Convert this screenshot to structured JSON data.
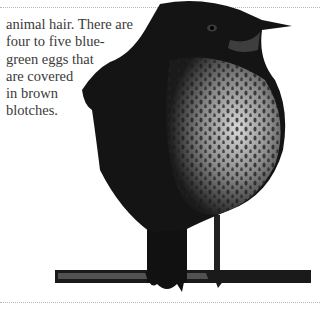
{
  "article": {
    "lines": [
      "animal hair. There are",
      "four to five blue-",
      "green eggs that",
      "are covered",
      "in brown",
      "blotches."
    ],
    "line_words": {
      "l0": [
        "animal",
        "hair.",
        "There",
        "are"
      ],
      "l1": [
        "four",
        "to",
        "five",
        "blue-"
      ],
      "l3": [
        "are",
        "covered"
      ],
      "l4": [
        "in",
        "brown"
      ]
    }
  },
  "image": {
    "subject": "bird-perched-on-branch",
    "style": "black-and-white"
  }
}
